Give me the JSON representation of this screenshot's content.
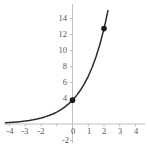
{
  "chart_data": {
    "type": "line",
    "title": "",
    "subtitle": "",
    "xlabel": "",
    "ylabel": "",
    "xlim": [
      -4.4,
      4.4
    ],
    "ylim": [
      -2.6,
      14.6
    ],
    "grid": false,
    "function": "y = 3 * 2^x",
    "x_ticks": [
      -4,
      -3,
      -2,
      0,
      1,
      2,
      3,
      4
    ],
    "x_tick_labels": [
      "-4",
      "-3",
      "-2",
      "0",
      "1",
      "2",
      "3",
      "4"
    ],
    "y_ticks": [
      -2,
      4,
      6,
      8,
      10,
      12,
      14
    ],
    "y_tick_labels": [
      "-2",
      "4",
      "6",
      "8",
      "10",
      "12",
      "14"
    ],
    "series": [
      {
        "name": "exponential-curve",
        "color": "#2b2b2b",
        "x": [
          -4.25,
          -4.0,
          -3.75,
          -3.5,
          -3.25,
          -3.0,
          -2.75,
          -2.5,
          -2.25,
          -2.0,
          -1.75,
          -1.5,
          -1.25,
          -1.0,
          -0.75,
          -0.5,
          -0.25,
          0.0,
          0.25,
          0.5,
          0.75,
          1.0,
          1.25,
          1.5,
          1.75,
          2.0,
          2.1,
          2.2,
          2.25
        ],
        "y": [
          0.158,
          0.188,
          0.223,
          0.265,
          0.315,
          0.375,
          0.446,
          0.53,
          0.63,
          0.75,
          0.892,
          1.061,
          1.261,
          1.5,
          1.784,
          2.121,
          2.523,
          3.0,
          3.568,
          4.243,
          5.045,
          6.0,
          7.135,
          8.485,
          10.09,
          12.0,
          12.86,
          13.78,
          14.26
        ]
      }
    ],
    "markers": [
      {
        "name": "y-intercept-point",
        "x": 0,
        "y": 3,
        "color": "#1a1a1a"
      },
      {
        "name": "curve-point",
        "x": 2,
        "y": 12,
        "color": "#1a1a1a"
      }
    ],
    "axis_color": "#bfbfbf",
    "curve_color": "#2b2b2b"
  }
}
